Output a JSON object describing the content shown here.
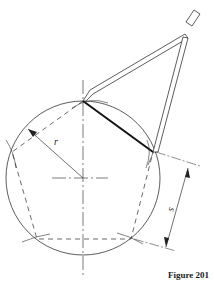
{
  "figure": {
    "caption": "Figure 201",
    "labels": {
      "radius": "r",
      "side": "s"
    },
    "colors": {
      "line": "#333333",
      "background": "#ffffff"
    },
    "geometry": {
      "circle_center": [
        83,
        178
      ],
      "circle_radius": 77,
      "pentagon_vertices": [
        [
          83,
          101
        ],
        [
          153,
          152
        ],
        [
          131,
          239
        ],
        [
          37,
          239
        ],
        [
          12,
          152
        ]
      ]
    }
  }
}
